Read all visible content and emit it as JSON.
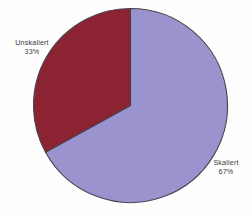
{
  "chart_data": {
    "type": "pie",
    "title": "",
    "subtitle": "",
    "xlabel": "",
    "ylabel": "",
    "legend_position": "none",
    "grid": false,
    "labels_inline": true,
    "categories": [
      "Skaliert",
      "Unskaliert"
    ],
    "values": [
      67,
      33
    ],
    "units": "%",
    "start_angle_deg": 0,
    "direction": "clockwise",
    "slices": [
      {
        "name": "Skaliert",
        "value": 67,
        "value_label": "67%",
        "color": "#9b93ce",
        "start_angle_deg": 0,
        "sweep_angle_deg": 241.2,
        "label_position": "outside-bottom-right"
      },
      {
        "name": "Unskaliert",
        "value": 33,
        "value_label": "33%",
        "color": "#8b2332",
        "start_angle_deg": 241.2,
        "sweep_angle_deg": 118.8,
        "label_position": "outside-top-left"
      }
    ]
  },
  "chart": {
    "background_color": "#fefefe",
    "outline_color": "#4a4450",
    "label_text_color": "#3a3a3a",
    "labels": {
      "unskaliert": {
        "name": "Unskaliert",
        "value": "33%"
      },
      "skaliert": {
        "name": "Skaliert",
        "value": "67%"
      }
    }
  }
}
